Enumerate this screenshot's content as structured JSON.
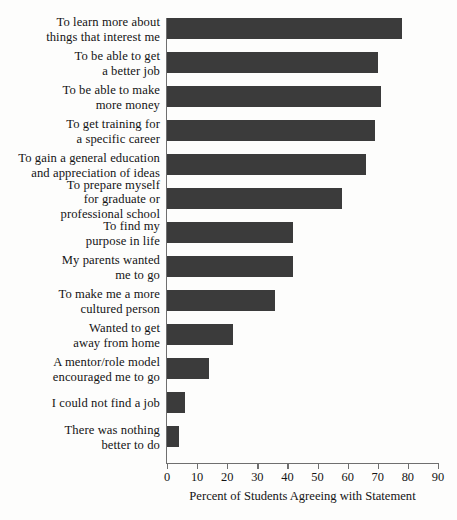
{
  "chart_data": {
    "type": "bar",
    "orientation": "horizontal",
    "title": "",
    "xlabel": "Percent of Students Agreeing with Statement",
    "ylabel": "",
    "xlim": [
      0,
      90
    ],
    "xticks": [
      0,
      10,
      20,
      30,
      40,
      50,
      60,
      70,
      80,
      90
    ],
    "grid": false,
    "legend": false,
    "bar_color": "#3b3b3b",
    "background_color": "#fdfdfc",
    "categories": [
      "To learn more about\nthings that interest me",
      "To be able to get\na better job",
      "To be able to make\nmore money",
      "To get training for\na specific career",
      "To gain a general education\nand appreciation of ideas",
      "To prepare myself\nfor graduate or\nprofessional school",
      "To find my\npurpose in life",
      "My parents wanted\nme to go",
      "To make me a more\ncultured person",
      "Wanted to get\naway from home",
      "A mentor/role model\nencouraged me to go",
      "I could not find a job",
      "There was nothing\nbetter to do"
    ],
    "values": [
      78,
      70,
      71,
      69,
      66,
      58,
      42,
      42,
      36,
      22,
      14,
      6,
      4
    ]
  }
}
